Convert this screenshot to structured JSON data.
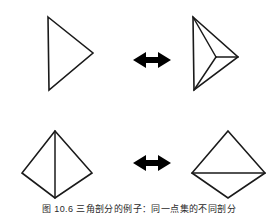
{
  "figure": {
    "background_color": "#ffffff",
    "stroke_color": "#1a1a1a",
    "arrow_color": "#000000",
    "caption": "图 10.6  三角剖分的例子：同一点集的不同剖分",
    "caption_truncated": true
  },
  "rows": [
    {
      "id": "row-top",
      "left_shape": {
        "name": "triangle-plain",
        "label": "triangle-pointing-right",
        "vertices": [
          [
            48,
            17
          ],
          [
            93,
            53
          ],
          [
            49,
            90
          ]
        ],
        "interior_edges": []
      },
      "arrow": {
        "name": "double-headed-arrow",
        "label": "bidirectional-arrow",
        "direction": "horizontal",
        "center": [
          152,
          60
        ]
      },
      "right_shape": {
        "name": "triangle-subdivided",
        "label": "triangle-with-interior-point",
        "vertices": [
          [
            193,
            17
          ],
          [
            238,
            57
          ],
          [
            194,
            90
          ]
        ],
        "interior_point": [
          216,
          57
        ],
        "interior_edges": [
          [
            [
              193,
              17
            ],
            [
              216,
              57
            ]
          ],
          [
            [
              238,
              57
            ],
            [
              216,
              57
            ]
          ],
          [
            [
              194,
              90
            ],
            [
              216,
              57
            ]
          ]
        ]
      }
    },
    {
      "id": "row-bottom",
      "left_shape": {
        "name": "quad-vertical-diagonal",
        "label": "quadrilateral-split-vertically",
        "vertices": [
          [
            55,
            131
          ],
          [
            92,
            173
          ],
          [
            55,
            198
          ],
          [
            22,
            173
          ]
        ],
        "interior_edges": [
          [
            [
              55,
              131
            ],
            [
              55,
              198
            ]
          ]
        ]
      },
      "arrow": {
        "name": "double-headed-arrow",
        "label": "bidirectional-arrow",
        "direction": "horizontal",
        "center": [
          152,
          163
        ]
      },
      "right_shape": {
        "name": "quad-horizontal-diagonal",
        "label": "quadrilateral-split-horizontally",
        "vertices": [
          [
            228,
            131
          ],
          [
            265,
            173
          ],
          [
            228,
            198
          ],
          [
            192,
            173
          ]
        ],
        "interior_edges": [
          [
            [
              192,
              173
            ],
            [
              265,
              173
            ]
          ]
        ]
      }
    }
  ]
}
